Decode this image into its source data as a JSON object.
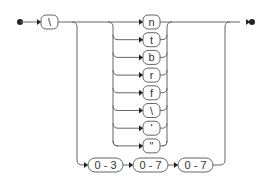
{
  "diagram": {
    "type": "railroad",
    "start_symbol": "\\",
    "escape_choices": [
      "n",
      "t",
      "b",
      "r",
      "f",
      "\\",
      "'",
      "\""
    ],
    "octal_sequence": [
      "0 - 3",
      "0 - 7",
      "0 - 7"
    ],
    "colors": {
      "line": "#666666",
      "marker": "#222222",
      "background": "#ffffff"
    }
  }
}
